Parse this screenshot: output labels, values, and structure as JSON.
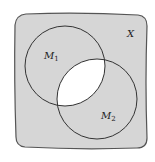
{
  "diagram": {
    "type": "venn",
    "universe": {
      "label": "X",
      "fill": "#d6d6d6",
      "stroke": "#555555"
    },
    "sets": [
      {
        "name": "M",
        "subscript": "1",
        "cx": 65,
        "cy": 66,
        "r": 40
      },
      {
        "name": "M",
        "subscript": "2",
        "cx": 97,
        "cy": 99,
        "r": 40
      }
    ],
    "intersection": {
      "fill": "#ffffff",
      "description": "M1 ∩ M2 unshaded"
    },
    "circle_stroke": "#333333"
  }
}
